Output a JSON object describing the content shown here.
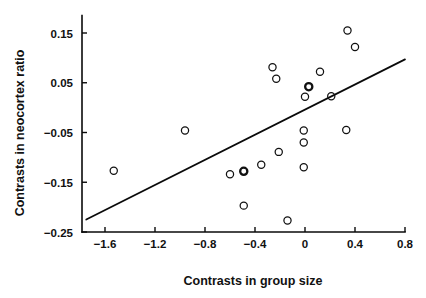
{
  "chart_data": {
    "type": "scatter",
    "title": "",
    "xlabel": "Contrasts in group size",
    "ylabel": "Contrasts in neocortex ratio",
    "xlim": [
      -1.75,
      0.8
    ],
    "ylim": [
      -0.25,
      0.185
    ],
    "grid": false,
    "legend": null,
    "x_ticks": [
      -1.6,
      -1.2,
      -0.8,
      -0.4,
      0,
      0.4,
      0.8
    ],
    "x_tick_labels": [
      "-1.6",
      "-1.2",
      "-0.8",
      "-0.4",
      "0",
      "0.4",
      "0.8"
    ],
    "y_ticks": [
      0.15,
      0.05,
      -0.05,
      -0.15,
      -0.25
    ],
    "y_tick_labels": [
      "0.15",
      "0.05",
      "-0.05",
      "-0.15",
      "-0.25"
    ],
    "marker": "open-circle",
    "points": [
      {
        "x": -1.53,
        "y": -0.127,
        "bold": false
      },
      {
        "x": -0.96,
        "y": -0.046,
        "bold": false
      },
      {
        "x": -0.6,
        "y": -0.134,
        "bold": false
      },
      {
        "x": -0.49,
        "y": -0.128,
        "bold": true
      },
      {
        "x": -0.49,
        "y": -0.197,
        "bold": false
      },
      {
        "x": -0.35,
        "y": -0.115,
        "bold": false
      },
      {
        "x": -0.26,
        "y": 0.081,
        "bold": false
      },
      {
        "x": -0.23,
        "y": 0.058,
        "bold": false
      },
      {
        "x": -0.21,
        "y": -0.089,
        "bold": false
      },
      {
        "x": -0.14,
        "y": -0.227,
        "bold": false
      },
      {
        "x": -0.01,
        "y": -0.046,
        "bold": false
      },
      {
        "x": -0.01,
        "y": -0.07,
        "bold": false
      },
      {
        "x": -0.01,
        "y": -0.12,
        "bold": false
      },
      {
        "x": 0.0,
        "y": 0.022,
        "bold": false
      },
      {
        "x": 0.03,
        "y": 0.042,
        "bold": true
      },
      {
        "x": 0.12,
        "y": 0.072,
        "bold": false
      },
      {
        "x": 0.21,
        "y": 0.023,
        "bold": false
      },
      {
        "x": 0.33,
        "y": -0.045,
        "bold": false
      },
      {
        "x": 0.34,
        "y": 0.155,
        "bold": false
      },
      {
        "x": 0.4,
        "y": 0.122,
        "bold": false
      }
    ],
    "trend_line": {
      "x_start": -1.75,
      "y_start": -0.225,
      "x_end": 0.8,
      "y_end": 0.097
    }
  },
  "colors": {
    "ink": "#111111",
    "background": "#ffffff"
  }
}
